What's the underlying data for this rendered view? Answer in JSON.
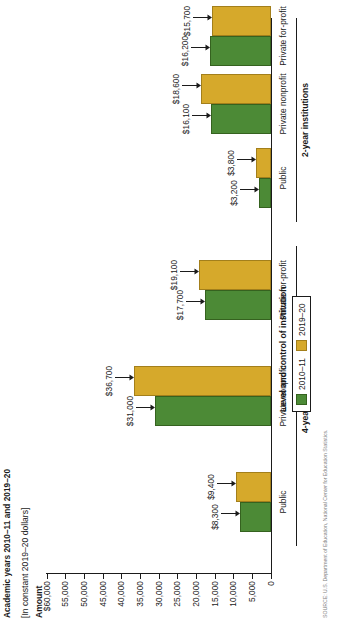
{
  "figure": {
    "title": "Academic years 2010–11 and 2019–20",
    "subtitle": "[In constant 2019–20 dollars]",
    "y_axis_label": "Amount",
    "legend_title": "Level and control of institution",
    "source_note": "SOURCE: U.S. Department of Education, National Center for Education Statistics."
  },
  "legend": {
    "items": [
      {
        "label": "2010–11",
        "color": "#4c8a36",
        "swatch": "g"
      },
      {
        "label": "2019–20",
        "color": "#d6a92b",
        "swatch": "y"
      }
    ]
  },
  "axis": {
    "ticks": [
      "$60,000",
      "55,000",
      "50,000",
      "45,000",
      "40,000",
      "35,000",
      "30,000",
      "25,000",
      "20,000",
      "15,000",
      "10,000",
      "5,000",
      "0"
    ],
    "tick_values": [
      60000,
      55000,
      50000,
      45000,
      40000,
      35000,
      30000,
      25000,
      20000,
      15000,
      10000,
      5000,
      0
    ]
  },
  "groups": [
    {
      "label": "4-year institutions"
    },
    {
      "label": "2-year institutions"
    }
  ],
  "categories": [
    {
      "label": "Public"
    },
    {
      "label": "Private nonprofit"
    },
    {
      "label": "Private for-profit"
    },
    {
      "label": "Public"
    },
    {
      "label": "Private nonprofit"
    },
    {
      "label": "Private for-profit"
    }
  ],
  "bar_labels": [
    "$8,300",
    "$9,400",
    "$31,000",
    "$36,700",
    "$17,700",
    "$19,100",
    "$3,200",
    "$3,800",
    "$16,100",
    "$18,600",
    "$16,200",
    "$15,700"
  ],
  "chart_data": {
    "type": "bar",
    "title": "Academic years 2010–11 and 2019–20",
    "subtitle": "[In constant 2019–20 dollars]",
    "xlabel": "Level and control of institution",
    "ylabel": "Amount",
    "ylim": [
      0,
      60000
    ],
    "ytick_step": 5000,
    "grid": false,
    "legend_position": "bottom-center",
    "orientation": "vertical",
    "group_labels": [
      "4-year institutions",
      "2-year institutions"
    ],
    "categories": [
      "Public",
      "Private nonprofit",
      "Private for-profit",
      "Public",
      "Private nonprofit",
      "Private for-profit"
    ],
    "series": [
      {
        "name": "2010–11",
        "color": "#4c8a36",
        "values": [
          8300,
          31000,
          17700,
          3200,
          16100,
          16200
        ]
      },
      {
        "name": "2019–20",
        "color": "#d6a92b",
        "values": [
          9400,
          36700,
          19100,
          3800,
          18600,
          15700
        ]
      }
    ]
  }
}
